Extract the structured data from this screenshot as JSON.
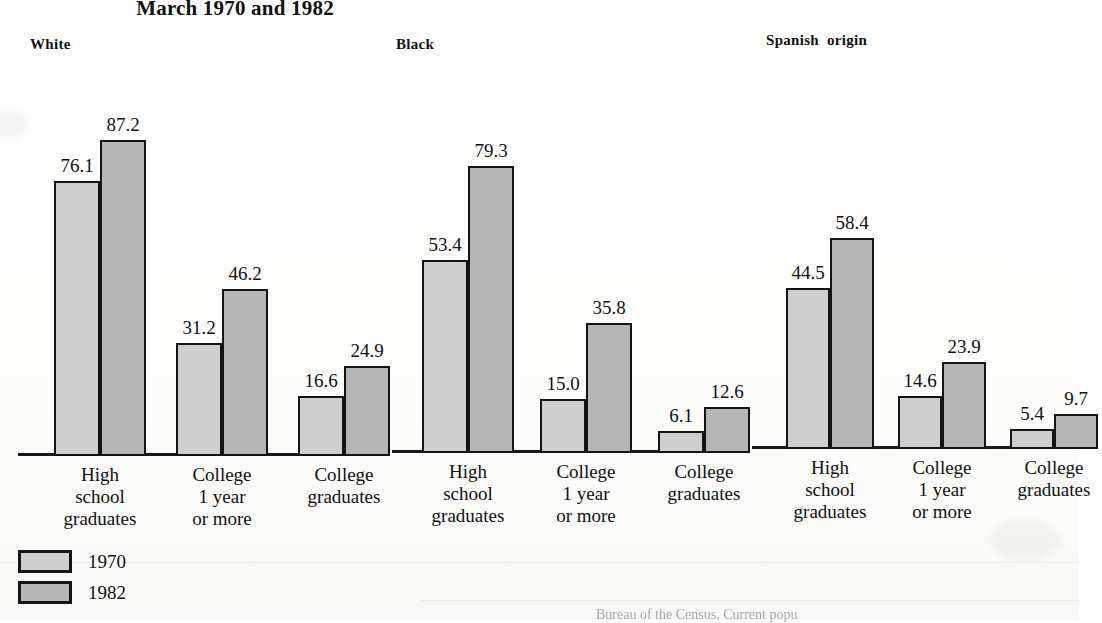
{
  "title": "March 1970 and 1982",
  "legend": [
    {
      "key": "y1970",
      "label": "1970",
      "color": "#cfcfcf"
    },
    {
      "key": "y1982",
      "label": "1982",
      "color": "#b6b6b6"
    }
  ],
  "source_note": "Bureau of the Census, Current popu",
  "groups": [
    {
      "name": "White",
      "header": "White"
    },
    {
      "name": "Black",
      "header": "Black"
    },
    {
      "name": "Spanish origin",
      "header": "Spanish  origin"
    }
  ],
  "categories": [
    "High\nschool\ngraduates",
    "College\n1 year\nor more",
    "College\ngraduates"
  ],
  "values": {
    "white": {
      "y1970": [
        "76.1",
        "31.2",
        "16.6"
      ],
      "y1982": [
        "87.2",
        "46.2",
        "24.9"
      ]
    },
    "black": {
      "y1970": [
        "53.4",
        "15.0",
        "6.1"
      ],
      "y1982": [
        "79.3",
        "35.8",
        "12.6"
      ]
    },
    "spanish": {
      "y1970": [
        "44.5",
        "14.6",
        "5.4"
      ],
      "y1982": [
        "58.4",
        "23.9",
        "9.7"
      ]
    }
  },
  "chart_data": {
    "type": "bar",
    "title": "March 1970 and 1982",
    "xlabel": "",
    "ylabel": "Percent",
    "ylim": [
      0,
      100
    ],
    "grid": false,
    "legend_position": "bottom-left",
    "categories": [
      "High school graduates",
      "College 1 year or more",
      "College graduates"
    ],
    "panels": [
      {
        "name": "White",
        "series": [
          {
            "name": "1970",
            "values": [
              76.1,
              31.2,
              16.6
            ]
          },
          {
            "name": "1982",
            "values": [
              87.2,
              46.2,
              24.9
            ]
          }
        ]
      },
      {
        "name": "Black",
        "series": [
          {
            "name": "1970",
            "values": [
              53.4,
              15.0,
              6.1
            ]
          },
          {
            "name": "1982",
            "values": [
              79.3,
              35.8,
              12.6
            ]
          }
        ]
      },
      {
        "name": "Spanish origin",
        "series": [
          {
            "name": "1970",
            "values": [
              44.5,
              14.6,
              5.4
            ]
          },
          {
            "name": "1982",
            "values": [
              58.4,
              23.9,
              9.7
            ]
          }
        ]
      }
    ],
    "annotations": [
      "Bureau of the Census, Current popu"
    ]
  }
}
